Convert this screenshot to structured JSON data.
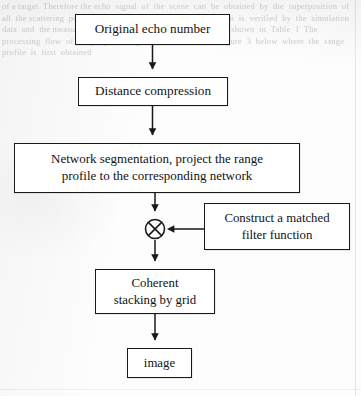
{
  "document": {
    "type": "scanned-flowchart",
    "background_bleed_text": "of a target  Therefore the echo  signal  of  the  scene  can  be  obtained  by  the  superposition  of  all  the scattering  points  In  this  paper  the  imaging  algorithm  is  verified  by  the  simulation  data  and  the measured  data  The  simulation  parameters  are  shown  in  Table  1  The  processing  flow  of  the proposed  algorithm  is  shown  in  Figure  3  below  where  the  range  profile  is  first  obtained",
    "ink_color": "#17191a",
    "paper_color": "#fdfdfd"
  },
  "flowchart": {
    "orientation": "top-to-bottom",
    "nodes": [
      {
        "id": "original-echo",
        "label": "Original echo number",
        "shape": "rectangle"
      },
      {
        "id": "distance-compression",
        "label": "Distance compression",
        "shape": "rectangle"
      },
      {
        "id": "network-segmentation",
        "label": "Network segmentation, project the range profile to the corresponding network",
        "line1": "Network segmentation, project the range",
        "line2": "profile to the corresponding network",
        "shape": "rectangle"
      },
      {
        "id": "multiply-junction",
        "label": "⊗",
        "icon": "multiply-circle-icon",
        "shape": "circle"
      },
      {
        "id": "matched-filter",
        "label": "Construct a matched filter function",
        "line1": "Construct a matched",
        "line2": "filter function",
        "shape": "rectangle"
      },
      {
        "id": "coherent-stacking",
        "label": "Coherent stacking by grid",
        "line1": "Coherent",
        "line2": "stacking by grid",
        "shape": "rectangle"
      },
      {
        "id": "image",
        "label": "image",
        "shape": "rectangle"
      }
    ],
    "edges": [
      {
        "from": "original-echo",
        "to": "distance-compression",
        "direction": "down"
      },
      {
        "from": "distance-compression",
        "to": "network-segmentation",
        "direction": "down"
      },
      {
        "from": "network-segmentation",
        "to": "multiply-junction",
        "direction": "down"
      },
      {
        "from": "matched-filter",
        "to": "multiply-junction",
        "direction": "left"
      },
      {
        "from": "multiply-junction",
        "to": "coherent-stacking",
        "direction": "down"
      },
      {
        "from": "coherent-stacking",
        "to": "image",
        "direction": "down"
      }
    ]
  }
}
